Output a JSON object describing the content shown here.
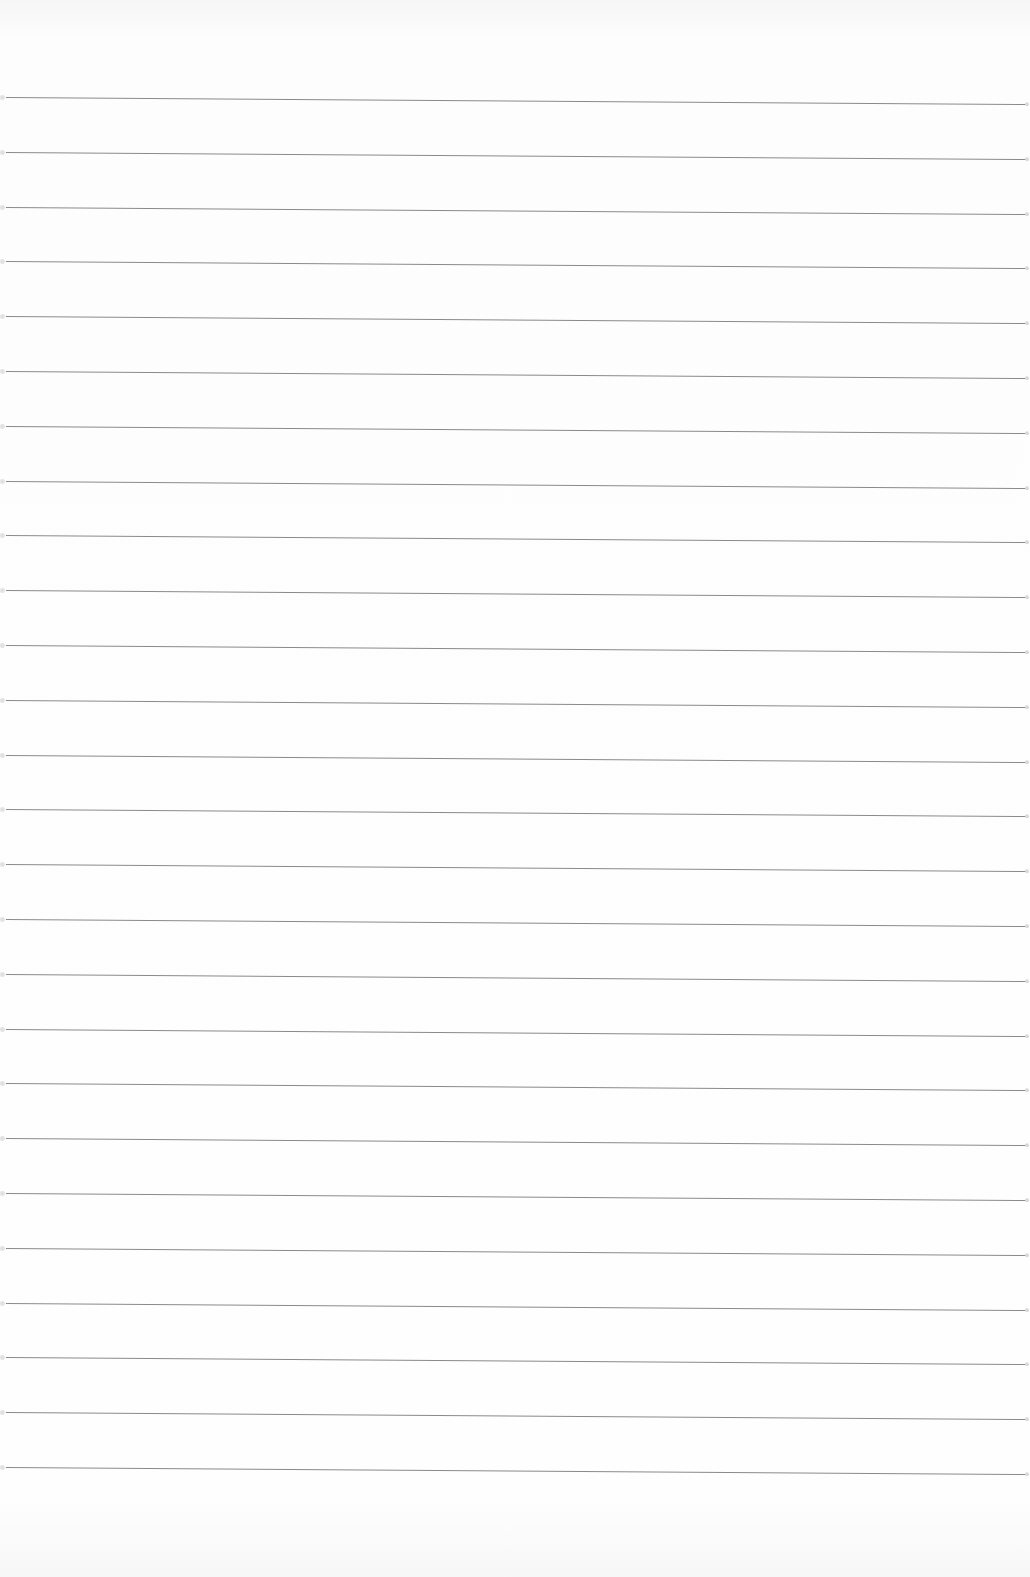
{
  "page": {
    "type": "ruled-notepaper",
    "background_color": "#fcfcfc",
    "line_color": "#8a8a8a",
    "line_count": 26,
    "first_line_y": 97,
    "line_spacing": 54.8,
    "text": ""
  }
}
